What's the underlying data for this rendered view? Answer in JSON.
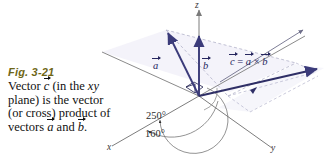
{
  "figure": {
    "number": "Fig. 3-21",
    "number_color": "#6e6617",
    "caption_parts": {
      "p1": "Vector ",
      "v_c": "c",
      "p2": " (in the ",
      "xy": "xy",
      "p3": " plane) is the vector (or cross) product of vectors ",
      "v_a": "a",
      "p4": " and ",
      "v_b": "b",
      "p5": "."
    }
  },
  "diagram": {
    "axes": {
      "z": "z",
      "x": "x",
      "y": "y"
    },
    "vectors": {
      "a": "a",
      "b": "b",
      "c_label_lhs": "c",
      "c_label_eq": " = ",
      "c_label_a": "a",
      "c_label_times": " × ",
      "c_label_b": "b"
    },
    "angles": [
      {
        "name": "outer-angle",
        "value": "250°"
      },
      {
        "name": "inner-angle",
        "value": "160°"
      }
    ],
    "colors": {
      "vector_stroke": "#3b3b7a",
      "axis_stroke": "#6b6b6b",
      "construction_dash": "#b9b9cf",
      "plane_fill": "#eceaf5"
    }
  }
}
